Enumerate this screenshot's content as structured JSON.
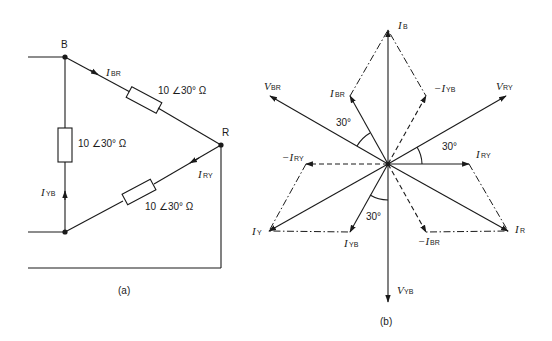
{
  "figure_a": {
    "caption": "(a)",
    "nodes": [
      "B",
      "R"
    ],
    "impedances": [
      {
        "id": "Z_BR",
        "label": "10 ∠30° Ω"
      },
      {
        "id": "Z_YB",
        "label": "10 ∠30° Ω"
      },
      {
        "id": "Z_RY",
        "label": "10 ∠30° Ω"
      }
    ],
    "currents": [
      {
        "id": "I_BR",
        "main": "I",
        "sub": "BR"
      },
      {
        "id": "I_YB",
        "main": "I",
        "sub": "YB"
      },
      {
        "id": "I_RY",
        "main": "I",
        "sub": "RY"
      }
    ]
  },
  "figure_b": {
    "caption": "(b)",
    "voltages": [
      {
        "id": "V_RY",
        "main": "V",
        "sub": "RY"
      },
      {
        "id": "V_BR",
        "main": "V",
        "sub": "BR"
      },
      {
        "id": "V_YB",
        "main": "V",
        "sub": "YB"
      }
    ],
    "currents": [
      {
        "id": "I_B",
        "main": "I",
        "sub": "B"
      },
      {
        "id": "I_BR",
        "main": "I",
        "sub": "BR"
      },
      {
        "id": "neg_I_YB",
        "main": "−I",
        "sub": "YB"
      },
      {
        "id": "I_RY",
        "main": "I",
        "sub": "RY"
      },
      {
        "id": "neg_I_RY",
        "main": "−I",
        "sub": "RY"
      },
      {
        "id": "I_Y",
        "main": "I",
        "sub": "Y"
      },
      {
        "id": "I_YB",
        "main": "I",
        "sub": "YB"
      },
      {
        "id": "neg_I_BR",
        "main": "−I",
        "sub": "BR"
      },
      {
        "id": "I_R",
        "main": "I",
        "sub": "R"
      }
    ],
    "angles": [
      "30°",
      "30°",
      "30°"
    ]
  }
}
